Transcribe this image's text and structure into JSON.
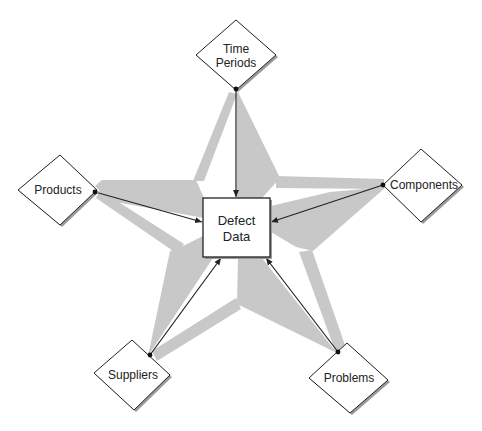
{
  "diagram": {
    "type": "star hub diagram",
    "center": {
      "label_line1": "Defect",
      "label_line2": "Data"
    },
    "nodes": [
      {
        "id": "time-periods",
        "label_line1": "Time",
        "label_line2": "Periods"
      },
      {
        "id": "components",
        "label_line1": "Components",
        "label_line2": ""
      },
      {
        "id": "problems",
        "label_line1": "Problems",
        "label_line2": ""
      },
      {
        "id": "suppliers",
        "label_line1": "Suppliers",
        "label_line2": ""
      },
      {
        "id": "products",
        "label_line1": "Products",
        "label_line2": ""
      }
    ],
    "edges": [
      {
        "from": "Time Periods",
        "to": "Defect Data"
      },
      {
        "from": "Components",
        "to": "Defect Data"
      },
      {
        "from": "Problems",
        "to": "Defect Data"
      },
      {
        "from": "Suppliers",
        "to": "Defect Data"
      },
      {
        "from": "Products",
        "to": "Defect Data"
      }
    ],
    "colors": {
      "star_fill": "#c8c8c8",
      "line": "#222222",
      "node_fill": "#ffffff",
      "shadow": "#9a9a9a"
    }
  }
}
